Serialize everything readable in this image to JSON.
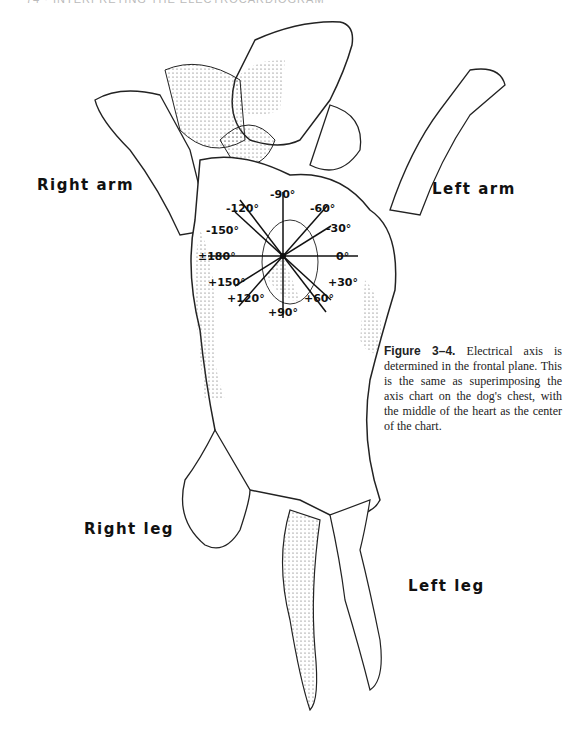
{
  "header": {
    "text": "74 · INTERPRETING THE ELECTROCARDIOGRAM"
  },
  "labels": {
    "right_arm": "Right arm",
    "left_arm": "Left arm",
    "right_leg": "Right leg",
    "left_leg": "Left leg"
  },
  "axis_chart": {
    "center": [
      283,
      256
    ],
    "angles": [
      {
        "deg": 0,
        "label": "0°"
      },
      {
        "deg": -30,
        "label": "-30°"
      },
      {
        "deg": -60,
        "label": "-60°"
      },
      {
        "deg": -90,
        "label": "-90°"
      },
      {
        "deg": -120,
        "label": "-120°"
      },
      {
        "deg": -150,
        "label": "-150°"
      },
      {
        "deg": 180,
        "label": "±180°"
      },
      {
        "deg": 150,
        "label": "+150°"
      },
      {
        "deg": 120,
        "label": "+120°"
      },
      {
        "deg": 90,
        "label": "+90°"
      },
      {
        "deg": 60,
        "label": "+60°"
      },
      {
        "deg": 30,
        "label": "+30°"
      }
    ]
  },
  "caption": {
    "figure": "Figure 3–4.",
    "text": "Electrical axis is determined in the frontal plane. This is the same as superimposing the axis chart on the dog's chest, with the middle of the heart as the center of the chart."
  }
}
